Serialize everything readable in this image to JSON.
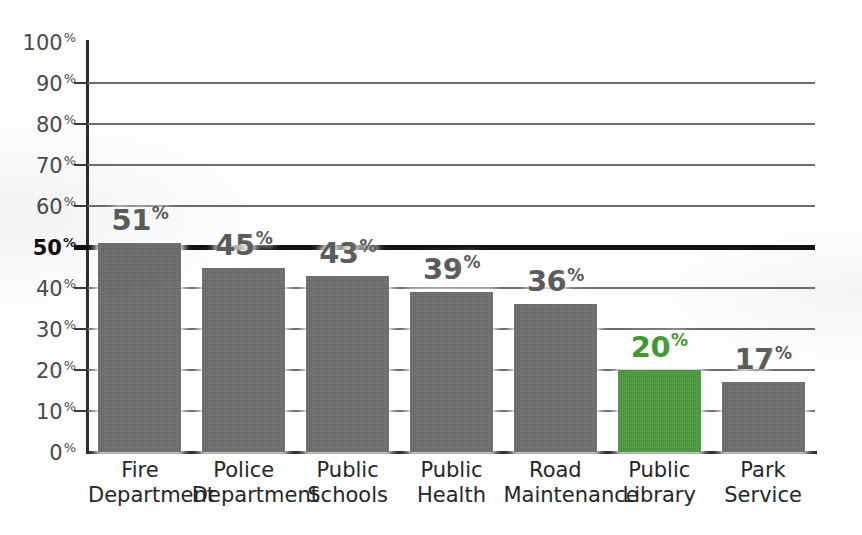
{
  "chart_data": {
    "type": "bar",
    "title": "",
    "xlabel": "",
    "ylabel": "",
    "ylim": [
      0,
      100
    ],
    "grid": true,
    "legend": "none",
    "categories": [
      "Fire Department",
      "Police Department",
      "Public Schools",
      "Public Health",
      "Road Maintenance",
      "Public Library",
      "Park Service"
    ],
    "category_lines": [
      [
        "Fire",
        "Department"
      ],
      [
        "Police",
        "Department"
      ],
      [
        "Public",
        "Schools"
      ],
      [
        "Public",
        "Health"
      ],
      [
        "Road",
        "Maintenance"
      ],
      [
        "Public",
        "Library"
      ],
      [
        "Park",
        "Service"
      ]
    ],
    "values": [
      51,
      45,
      43,
      39,
      36,
      20,
      17
    ],
    "value_labels": [
      "51",
      "45",
      "43",
      "39",
      "36",
      "20",
      "17"
    ],
    "percent_symbol": "%",
    "bar_colors": [
      "#6b6b6b",
      "#6b6b6b",
      "#6b6b6b",
      "#6b6b6b",
      "#6b6b6b",
      "#4a9a3c",
      "#6b6b6b"
    ],
    "label_colors": [
      "#5b5b5b",
      "#5b5b5b",
      "#5b5b5b",
      "#5b5b5b",
      "#5b5b5b",
      "#3f9a31",
      "#5b5b5b"
    ],
    "highlight_category": "Public Library",
    "highlight_color": "#4a9a3c",
    "y_ticks": [
      0,
      10,
      20,
      30,
      40,
      50,
      60,
      70,
      80,
      90,
      100
    ],
    "y_tick_labels": [
      "0",
      "10",
      "20",
      "30",
      "40",
      "50",
      "60",
      "70",
      "80",
      "90",
      "100"
    ],
    "emphasized_tick": 50,
    "emphasized_gridline": 50,
    "gridlines_at": [
      10,
      20,
      30,
      40,
      50,
      60,
      70,
      80,
      90
    ]
  },
  "axis": {
    "y_line_color": "#2b2b2b",
    "x_line_color": "#2b2b2b",
    "gridline_color": "#6d6d6d",
    "bold_gridline_color": "#111111"
  }
}
